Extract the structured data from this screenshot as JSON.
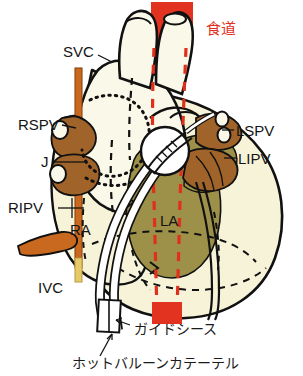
{
  "figure": {
    "title_semantic": "hot-balloon-catheter-ablation-left-atrium-esophagus-diagram",
    "background_color": "#ffffff"
  },
  "colors": {
    "background": "#ffffff",
    "outline": "#111111",
    "esophagus_red": "#e23320",
    "esophagus_dash": "#e0301c",
    "left_atrium_olive": "#9d9049",
    "chamber_cream": "#f6f3d8",
    "chamber_cream_light": "#faf8e8",
    "pulmonary_vein_brown": "#a0642a",
    "svc_orange": "#c8691f",
    "catheter_white": "#ffffff",
    "label_text": "#141414",
    "esophagus_label_text": "#e0301c"
  },
  "labels": {
    "svc": "SVC",
    "rspv": "RSPV",
    "j": "J",
    "ripv": "RIPV",
    "ra": "RA",
    "ivc": "IVC",
    "la": "LA",
    "lspv": "LSPV",
    "lipv": "LIPV",
    "esophagus": "食道",
    "guide_sheath": "ガイドシース",
    "hot_balloon_catheter": "ホットバルーンカテーテル"
  },
  "structures": [
    {
      "id": "esophagus-band-top",
      "label": "食道",
      "kind": "red-band",
      "position": "top-center"
    },
    {
      "id": "esophagus-band-bottom",
      "label": "食道",
      "kind": "red-band",
      "position": "bottom-center"
    },
    {
      "id": "esophagus-path",
      "label": "食道",
      "kind": "dashed-path",
      "position": "center-vertical"
    },
    {
      "id": "superior-vena-cava",
      "label": "SVC",
      "kind": "vessel",
      "position": "upper-left"
    },
    {
      "id": "right-superior-pulmonary-vein",
      "label": "RSPV",
      "kind": "vein",
      "position": "left"
    },
    {
      "id": "right-inferior-pulmonary-vein",
      "label": "RIPV",
      "kind": "vein",
      "position": "lower-left"
    },
    {
      "id": "left-superior-pulmonary-vein",
      "label": "LSPV",
      "kind": "vein",
      "position": "right"
    },
    {
      "id": "left-inferior-pulmonary-vein",
      "label": "LIPV",
      "kind": "vein",
      "position": "right"
    },
    {
      "id": "right-atrium",
      "label": "RA",
      "kind": "chamber",
      "position": "lower-left"
    },
    {
      "id": "left-atrium",
      "label": "LA",
      "kind": "chamber",
      "position": "center"
    },
    {
      "id": "inferior-vena-cava",
      "label": "IVC",
      "kind": "vessel",
      "position": "bottom-left"
    },
    {
      "id": "junction",
      "label": "J",
      "kind": "landmark",
      "position": "left"
    },
    {
      "id": "guide-sheath",
      "label": "ガイドシース",
      "kind": "device",
      "position": "bottom"
    },
    {
      "id": "hot-balloon-catheter",
      "label": "ホットバルーンカテーテル",
      "kind": "device",
      "position": "bottom"
    }
  ]
}
